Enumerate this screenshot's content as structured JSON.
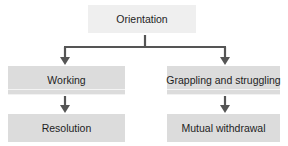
{
  "diagram": {
    "type": "flowchart",
    "colors": {
      "top_box": "#efefef",
      "lower_boxes": "#dcdcdc",
      "arrows": "#555555",
      "text": "#1e1e1e"
    },
    "nodes": {
      "root": {
        "label": "Orientation"
      },
      "left": {
        "label": "Working"
      },
      "right": {
        "label": "Grappling and struggling"
      },
      "left_outcome": {
        "label": "Resolution"
      },
      "right_outcome": {
        "label": "Mutual withdrawal"
      }
    },
    "edges": [
      {
        "from": "Orientation",
        "to": "Working"
      },
      {
        "from": "Orientation",
        "to": "Grappling and struggling"
      },
      {
        "from": "Working",
        "to": "Resolution"
      },
      {
        "from": "Grappling and struggling",
        "to": "Mutual withdrawal"
      }
    ]
  }
}
